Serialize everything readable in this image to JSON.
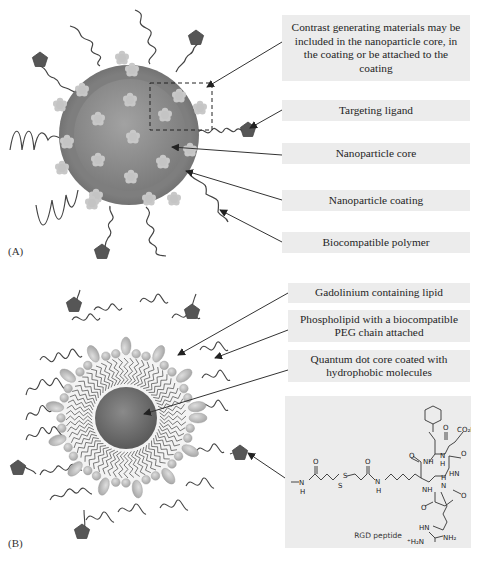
{
  "panels": {
    "a": {
      "label": "(A)",
      "callouts": [
        {
          "id": "contrast",
          "text": "Contrast generating materials may be included in the nanoparticle core, in the coating or be attached to the coating"
        },
        {
          "id": "ligand",
          "text": "Targeting ligand"
        },
        {
          "id": "core",
          "text": "Nanoparticle core"
        },
        {
          "id": "coating",
          "text": "Nanoparticle coating"
        },
        {
          "id": "polymer",
          "text": "Biocompatible polymer"
        }
      ]
    },
    "b": {
      "label": "(B)",
      "callouts": [
        {
          "id": "gd-lipid",
          "text": "Gadolinium containing lipid"
        },
        {
          "id": "peg-lipid",
          "text": "Phospholipid with a biocompatible PEG chain attached"
        },
        {
          "id": "qd-core",
          "text": "Quantum dot core coated with hydrophobic molecules"
        }
      ],
      "rgd": {
        "caption": "RGD peptide",
        "atoms": {
          "o": "O",
          "nh": "NH",
          "n": "N",
          "h": "H",
          "s": "S",
          "hn": "HN",
          "co2h": "CO₂H",
          "nh2": "NH₂",
          "h2n_plus": "⁺H₂N"
        }
      }
    }
  },
  "colors": {
    "coating": "#7a7a7a",
    "core": "#8e8e8e",
    "ligand": "#555555",
    "contrast_dot": "#c4c4c4",
    "callout_bg": "#ececec",
    "lipid_head": "#b8b8b8",
    "qd_core": "#6e6e6e"
  }
}
